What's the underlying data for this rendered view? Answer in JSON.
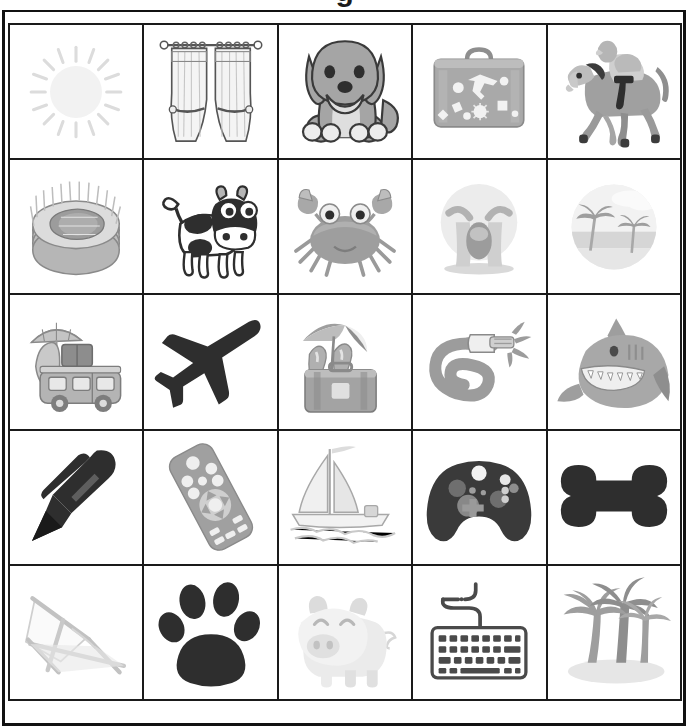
{
  "page": {
    "title_partial": "g",
    "background_color": "#ffffff",
    "border_color": "#1a1a1a",
    "grid": {
      "rows": 5,
      "columns": 5,
      "total_cells": 25
    }
  },
  "palette": {
    "ink": "#1a1a1a",
    "dark": "#2b2b2b",
    "mid_gray": "#8e8e8e",
    "gray": "#a8a8a8",
    "light_gray": "#c9c9c9",
    "pale_gray": "#e3e3e3",
    "faint": "#f0f0f0",
    "white": "#ffffff"
  },
  "cells": [
    {
      "row": 1,
      "col": 1,
      "icon": "sun-icon",
      "label": "Sun"
    },
    {
      "row": 1,
      "col": 2,
      "icon": "curtains-icon",
      "label": "Curtains"
    },
    {
      "row": 1,
      "col": 3,
      "icon": "dog-icon",
      "label": "Dog"
    },
    {
      "row": 1,
      "col": 4,
      "icon": "suitcase-icon",
      "label": "Suitcase"
    },
    {
      "row": 1,
      "col": 5,
      "icon": "horse-jockey-icon",
      "label": "Horse with jockey"
    },
    {
      "row": 2,
      "col": 1,
      "icon": "stadium-icon",
      "label": "Stadium"
    },
    {
      "row": 2,
      "col": 2,
      "icon": "cow-icon",
      "label": "Cow"
    },
    {
      "row": 2,
      "col": 3,
      "icon": "crab-icon",
      "label": "Crab"
    },
    {
      "row": 2,
      "col": 4,
      "icon": "crying-face-icon",
      "label": "Loudly crying face"
    },
    {
      "row": 2,
      "col": 5,
      "icon": "beach-scene-icon",
      "label": "Beach scene"
    },
    {
      "row": 3,
      "col": 1,
      "icon": "camper-van-icon",
      "label": "Camper van with surfboard"
    },
    {
      "row": 3,
      "col": 2,
      "icon": "airplane-icon",
      "label": "Airplane"
    },
    {
      "row": 3,
      "col": 3,
      "icon": "beach-luggage-icon",
      "label": "Luggage with flip flops and umbrella"
    },
    {
      "row": 3,
      "col": 4,
      "icon": "garden-hose-icon",
      "label": "Garden hose"
    },
    {
      "row": 3,
      "col": 5,
      "icon": "shark-icon",
      "label": "Shark"
    },
    {
      "row": 4,
      "col": 1,
      "icon": "pen-icon",
      "label": "Pen"
    },
    {
      "row": 4,
      "col": 2,
      "icon": "remote-control-icon",
      "label": "TV remote control"
    },
    {
      "row": 4,
      "col": 3,
      "icon": "sailboat-icon",
      "label": "Sailboat"
    },
    {
      "row": 4,
      "col": 4,
      "icon": "game-controller-icon",
      "label": "Game controller"
    },
    {
      "row": 4,
      "col": 5,
      "icon": "dog-bone-icon",
      "label": "Dog bone"
    },
    {
      "row": 5,
      "col": 1,
      "icon": "deck-chair-icon",
      "label": "Deck chair"
    },
    {
      "row": 5,
      "col": 2,
      "icon": "paw-print-icon",
      "label": "Paw print"
    },
    {
      "row": 5,
      "col": 3,
      "icon": "pig-icon",
      "label": "Pig"
    },
    {
      "row": 5,
      "col": 4,
      "icon": "keyboard-icon",
      "label": "Keyboard"
    },
    {
      "row": 5,
      "col": 5,
      "icon": "palm-trees-icon",
      "label": "Palm trees on island"
    }
  ]
}
